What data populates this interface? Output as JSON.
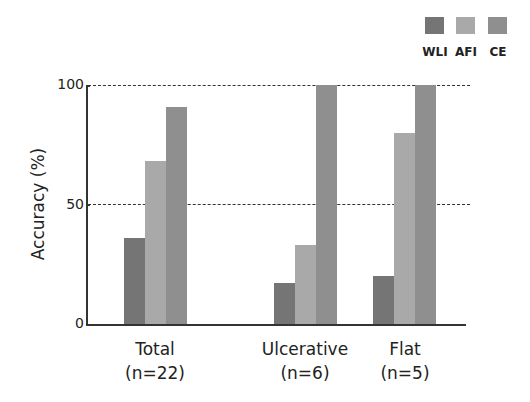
{
  "chart_data": {
    "type": "bar",
    "title": "",
    "xlabel": "",
    "ylabel": "Accuracy (%)",
    "ylim": [
      0,
      100
    ],
    "yticks": [
      0,
      50,
      100
    ],
    "gridlines": {
      "dashed_at": [
        50,
        100
      ]
    },
    "legend_position": "top-right",
    "categories": [
      {
        "name": "Total",
        "n": "(n=22)"
      },
      {
        "name": "Ulcerative",
        "n": "(n=6)"
      },
      {
        "name": "Flat",
        "n": "(n=5)"
      }
    ],
    "series": [
      {
        "name": "WLI",
        "color": "#757575",
        "values": [
          36,
          17,
          20
        ]
      },
      {
        "name": "AFI",
        "color": "#a9a9a9",
        "values": [
          68,
          33,
          80
        ]
      },
      {
        "name": "CE",
        "color": "#8f8f8f",
        "values": [
          91,
          100,
          100
        ]
      }
    ]
  }
}
